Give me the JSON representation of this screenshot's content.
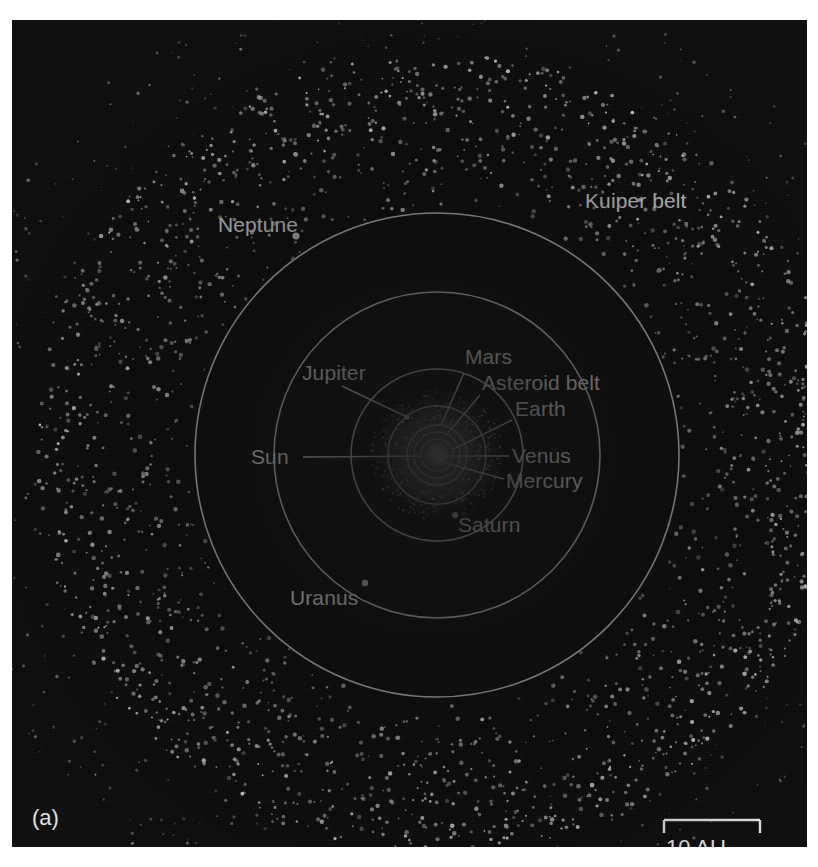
{
  "figure": {
    "panel_label": "(a)",
    "caption_type": "solar-system-orbital-diagram",
    "background_color": "#0a0a0a",
    "ink_color": "#f2f2f2"
  },
  "scale": {
    "label": "10 AU",
    "bar_length_px": 96
  },
  "labels": {
    "sun": "Sun",
    "mercury": "Mercury",
    "venus": "Venus",
    "earth": "Earth",
    "mars": "Mars",
    "asteroid_belt": "Asteroid belt",
    "jupiter": "Jupiter",
    "saturn": "Saturn",
    "uranus": "Uranus",
    "neptune": "Neptune",
    "kuiper_belt": "Kuiper belt"
  },
  "chart_data": {
    "type": "scatter",
    "projection": "top-down ecliptic plane, heliocentric",
    "units": "AU",
    "scale_bar_au": 10,
    "axis_ranges": {
      "x_au": [
        -38,
        38
      ],
      "y_au": [
        -38,
        38
      ]
    },
    "grid": false,
    "legend": "none",
    "center": {
      "name": "Sun",
      "x_au": 0,
      "y_au": 0
    },
    "orbits": [
      {
        "name": "Mercury",
        "semimajor_au": 0.39,
        "drawn": true
      },
      {
        "name": "Venus",
        "semimajor_au": 0.72,
        "drawn": true
      },
      {
        "name": "Earth",
        "semimajor_au": 1.0,
        "drawn": true
      },
      {
        "name": "Mars",
        "semimajor_au": 1.52,
        "drawn": true
      },
      {
        "name": "Jupiter",
        "semimajor_au": 5.2,
        "drawn": true
      },
      {
        "name": "Saturn",
        "semimajor_au": 9.58,
        "drawn": true
      },
      {
        "name": "Uranus",
        "semimajor_au": 19.2,
        "drawn": true
      },
      {
        "name": "Neptune",
        "semimajor_au": 30.1,
        "drawn": true
      }
    ],
    "bodies": [
      {
        "name": "Neptune",
        "orbit_au": 30.1,
        "angle_deg": 143,
        "labeled": true
      },
      {
        "name": "Uranus",
        "orbit_au": 19.2,
        "angle_deg": 240,
        "labeled": true
      },
      {
        "name": "Saturn",
        "orbit_au": 9.58,
        "angle_deg": 298,
        "labeled": true
      },
      {
        "name": "Jupiter",
        "orbit_au": 5.2,
        "angle_deg": 128,
        "labeled": true
      }
    ],
    "regions": [
      {
        "name": "Asteroid belt",
        "inner_au": 2.1,
        "outer_au": 3.3,
        "style": "diffuse glow"
      },
      {
        "name": "Kuiper belt",
        "inner_au": 30,
        "outer_au": 50,
        "style": "scattered points"
      }
    ]
  }
}
